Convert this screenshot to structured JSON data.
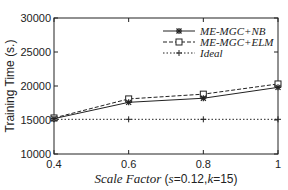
{
  "chart_data": {
    "type": "line",
    "title": "",
    "xlabel": "Scale Factor (s=0.12, k=15)",
    "ylabel": "Training Time (s.)",
    "x": [
      0.4,
      0.6,
      0.8,
      1.0
    ],
    "x_ticks": [
      "0.4",
      "0.6",
      "0.8",
      "1"
    ],
    "y_ticks": [
      "10000",
      "15000",
      "20000",
      "25000",
      "30000"
    ],
    "xlim": [
      0.4,
      1.0
    ],
    "ylim": [
      10000,
      30000
    ],
    "grid": false,
    "legend_position": "upper right",
    "series": [
      {
        "name": "ME-MGC+NB",
        "style": "solid",
        "marker": "asterisk",
        "values": [
          15200,
          17600,
          18200,
          19800
        ]
      },
      {
        "name": "ME-MGC+ELM",
        "style": "dashed",
        "marker": "square",
        "values": [
          15300,
          18100,
          18800,
          20300
        ]
      },
      {
        "name": "Ideal",
        "style": "dotted",
        "marker": "plus",
        "values": [
          15100,
          15100,
          15100,
          15100
        ]
      }
    ]
  },
  "labels": {
    "ylabel": "Training Time (s.)",
    "xlabel_prefix": "Scale Factor (",
    "xlabel_s": "s",
    "xlabel_s_val": "=0.12,",
    "xlabel_k": "k",
    "xlabel_k_val": "=15)"
  }
}
